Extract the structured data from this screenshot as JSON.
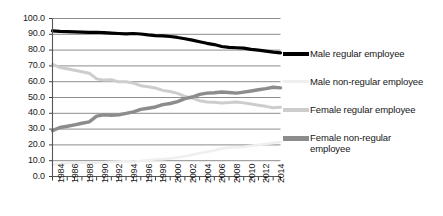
{
  "chart_data": {
    "type": "line",
    "title": "",
    "xlabel": "",
    "ylabel": "",
    "ylim": [
      0,
      100
    ],
    "ytick_labels": [
      "100.0",
      "90.0",
      "80.0",
      "70.0",
      "60.0",
      "50.0",
      "40.0",
      "30.0",
      "20.0",
      "10.0",
      "0.0"
    ],
    "ytick_values": [
      100,
      90,
      80,
      70,
      60,
      50,
      40,
      30,
      20,
      10,
      0
    ],
    "grid": true,
    "legend_position": "right",
    "x": [
      1984,
      1985,
      1986,
      1987,
      1988,
      1989,
      1990,
      1991,
      1992,
      1993,
      1994,
      1995,
      1996,
      1997,
      1998,
      1999,
      2000,
      2001,
      2002,
      2003,
      2004,
      2005,
      2006,
      2007,
      2008,
      2009,
      2010,
      2011,
      2012,
      2013,
      2014,
      2015
    ],
    "xtick_labels": [
      "1984",
      "1986",
      "1988",
      "1990",
      "1992",
      "1994",
      "1996",
      "1998",
      "2000",
      "2002",
      "2004",
      "2006",
      "2008",
      "2010",
      "2012",
      "2014"
    ],
    "xtick_label_years": [
      1984,
      1986,
      1988,
      1990,
      1992,
      1994,
      1996,
      1998,
      2000,
      2002,
      2004,
      2006,
      2008,
      2010,
      2012,
      2014
    ],
    "series": [
      {
        "name": "Male regular employee",
        "color": "#000000",
        "width": 3.2,
        "values": [
          92.2,
          91.8,
          91.7,
          91.5,
          91.4,
          91.2,
          91.3,
          91.0,
          90.7,
          90.5,
          90.3,
          90.5,
          90.2,
          89.6,
          89.2,
          89.0,
          88.6,
          88.0,
          87.2,
          86.3,
          85.3,
          84.3,
          83.5,
          82.3,
          81.7,
          81.5,
          81.3,
          80.5,
          80.0,
          79.4,
          78.7,
          78.2
        ]
      },
      {
        "name": "Male non-regular employee",
        "color": "#efefef",
        "width": 2.6,
        "values": [
          7.7,
          7.9,
          8.4,
          8.5,
          8.8,
          8.9,
          8.7,
          9.0,
          9.3,
          9.5,
          9.7,
          9.5,
          9.8,
          10.4,
          10.8,
          11.0,
          11.4,
          12.0,
          12.8,
          13.7,
          14.7,
          15.7,
          16.5,
          17.7,
          18.3,
          18.5,
          18.7,
          19.5,
          20.0,
          20.6,
          21.3,
          21.8
        ]
      },
      {
        "name": "Female regular employee",
        "color": "#cdcdcd",
        "width": 3.0,
        "values": [
          70.9,
          69.0,
          68.2,
          67.3,
          66.3,
          65.4,
          61.8,
          61.0,
          61.2,
          59.9,
          60.0,
          59.1,
          57.5,
          56.8,
          56.0,
          54.5,
          53.8,
          52.6,
          50.7,
          49.7,
          48.0,
          47.2,
          47.0,
          46.5,
          46.8,
          47.2,
          46.6,
          45.9,
          45.1,
          44.4,
          43.5,
          43.9
        ]
      },
      {
        "name": "Female non-regular employee",
        "color": "#8c8c8c",
        "width": 3.4,
        "values": [
          29.0,
          31.0,
          31.8,
          32.7,
          33.7,
          34.6,
          38.2,
          39.0,
          38.8,
          39.0,
          40.0,
          40.9,
          42.5,
          43.2,
          44.0,
          45.5,
          46.2,
          47.4,
          49.3,
          50.3,
          52.0,
          52.8,
          53.0,
          53.5,
          53.2,
          52.8,
          53.4,
          54.1,
          54.9,
          55.6,
          56.5,
          56.1
        ]
      }
    ],
    "legend": [
      {
        "label": "Male regular employee",
        "color": "#000000",
        "thickness": 4
      },
      {
        "label": "Male non-regular employee",
        "color": "#efefef",
        "thickness": 3
      },
      {
        "label": "Female regular employee",
        "color": "#cdcdcd",
        "thickness": 4
      },
      {
        "label": "Female non-regular employee",
        "color": "#8c8c8c",
        "thickness": 5
      }
    ]
  },
  "axes": {
    "axis_color": "#555555",
    "grid_color": "#8d8d8d",
    "tick_color": "#3f3f3f"
  }
}
